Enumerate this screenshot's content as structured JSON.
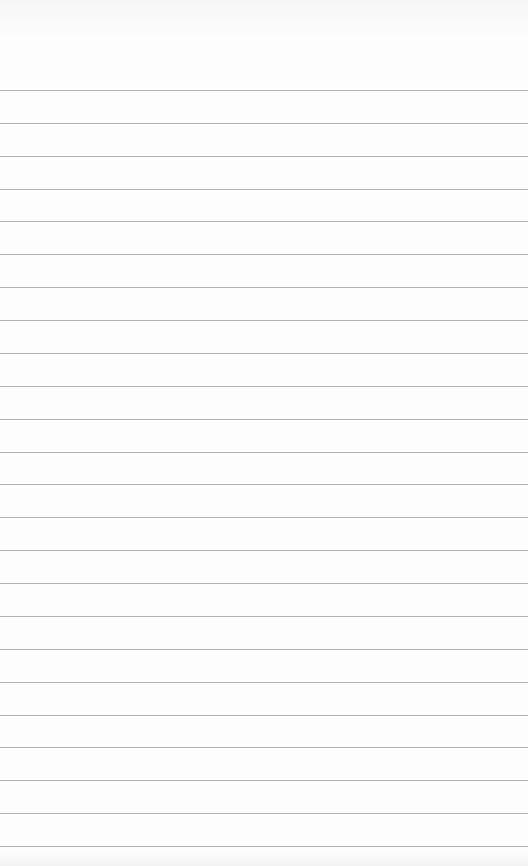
{
  "page": {
    "type": "blank-lined-paper",
    "text": "",
    "line_count": 24,
    "first_line_y": 90,
    "line_spacing_px": 32.87,
    "background_color": "#fdfdfd",
    "line_color": "#9a9a9a"
  }
}
